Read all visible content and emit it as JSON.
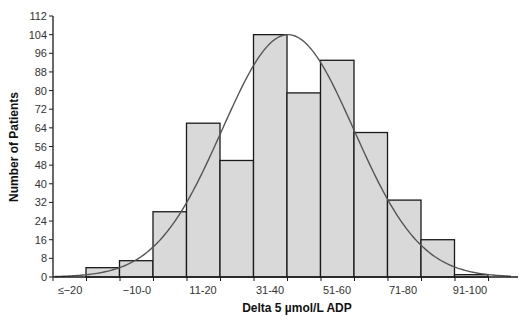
{
  "chart_data": {
    "type": "bar",
    "subtype": "histogram_with_normal_curve",
    "title": "",
    "xlabel": "Delta 5 µmol/L ADP",
    "ylabel": "Number of Patients",
    "ylim": [
      0,
      112
    ],
    "yticks": [
      0,
      8,
      16,
      24,
      32,
      40,
      48,
      56,
      64,
      72,
      80,
      88,
      96,
      104,
      112
    ],
    "xtick_labels": [
      "≤−20",
      "−10-0",
      "11-20",
      "31-40",
      "51-60",
      "71-80",
      "91-100"
    ],
    "categories": [
      "≤−20",
      "−19 to −11",
      "−10-0",
      "1-10",
      "11-20",
      "21-30",
      "31-40",
      "41-50",
      "51-60",
      "61-70",
      "71-80",
      "81-90",
      "91-100"
    ],
    "values": [
      0,
      4,
      7,
      28,
      66,
      50,
      104,
      79,
      93,
      62,
      33,
      16,
      1
    ],
    "bar_values": [
      4,
      7,
      28,
      66,
      50,
      104,
      79,
      93,
      62,
      33,
      16,
      1
    ],
    "curve": {
      "type": "normal_fit",
      "peak_value": 104,
      "color": "#555555"
    },
    "grid": false,
    "legend": null,
    "colors": {
      "bar_fill": "#d9d9d9",
      "bar_stroke": "#1a1a1a",
      "axis": "#1a1a1a"
    }
  }
}
